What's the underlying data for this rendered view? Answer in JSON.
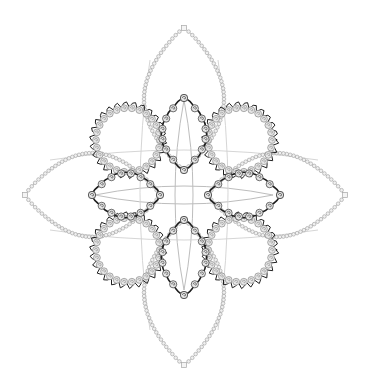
{
  "image": {
    "kind": "ornamental rosette",
    "width": 367,
    "height": 391,
    "background": "#ffffff",
    "center": [
      184,
      195
    ]
  },
  "colors": {
    "outer_bead": "#a8a8a8",
    "outer_line": "#c4c4c4",
    "spiral_fill": "#e6e6e6",
    "spiral_stroke": "#8a8a8a",
    "dark_line": "#1e1e1e",
    "cross_line": "#bdbdbd"
  },
  "outer_petals": [
    {
      "name": "north",
      "tip": [
        184,
        28
      ],
      "base": [
        184,
        170
      ],
      "half_width": 40
    },
    {
      "name": "south",
      "tip": [
        184,
        365
      ],
      "base": [
        184,
        220
      ],
      "half_width": 40
    },
    {
      "name": "west",
      "tip": [
        25,
        195
      ],
      "base": [
        160,
        195
      ],
      "half_width": 42
    },
    {
      "name": "east",
      "tip": [
        345,
        195
      ],
      "base": [
        208,
        195
      ],
      "half_width": 42
    }
  ],
  "diagonal_loops": [
    {
      "name": "north-west",
      "center": [
        128,
        140
      ],
      "rx": 32,
      "ry": 32
    },
    {
      "name": "north-east",
      "center": [
        240,
        140
      ],
      "rx": 32,
      "ry": 32
    },
    {
      "name": "south-west",
      "center": [
        128,
        250
      ],
      "rx": 32,
      "ry": 32
    },
    {
      "name": "south-east",
      "center": [
        240,
        250
      ],
      "rx": 32,
      "ry": 32
    }
  ],
  "inner_petals": [
    {
      "name": "north",
      "tip": [
        184,
        98
      ],
      "base": [
        184,
        170
      ],
      "half_width": 22
    },
    {
      "name": "south",
      "tip": [
        184,
        295
      ],
      "base": [
        184,
        220
      ],
      "half_width": 22
    },
    {
      "name": "west",
      "tip": [
        92,
        195
      ],
      "base": [
        160,
        195
      ],
      "half_width": 22
    },
    {
      "name": "east",
      "tip": [
        280,
        195
      ],
      "base": [
        208,
        195
      ],
      "half_width": 22
    }
  ]
}
